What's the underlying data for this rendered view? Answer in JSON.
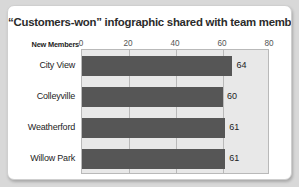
{
  "card": {
    "title": "“Customers-won” infographic shared with team members"
  },
  "chart_data": {
    "type": "bar",
    "orientation": "horizontal",
    "title": "“Customers-won” infographic shared with team members",
    "xlabel": "New Members",
    "ylabel": "",
    "categories": [
      "City View",
      "Colleyville",
      "Weatherford",
      "Willow Park"
    ],
    "values": [
      64,
      60,
      61,
      61
    ],
    "value_labels": [
      "64",
      "60",
      "61",
      "61"
    ],
    "xlim": [
      0,
      80
    ],
    "xticks": [
      0,
      20,
      40,
      60,
      80
    ],
    "xtick_labels": [
      "0",
      "20",
      "40",
      "60",
      "80"
    ],
    "grid": true,
    "legend": false,
    "bar_color": "#565656",
    "plot_background": "#e8e8e8",
    "plot_border_color": "#b9b9b9"
  },
  "colors": {
    "page_background": "#d8d8d8",
    "card_background": "#ffffff",
    "card_border": "#cfcfcf",
    "title_text": "#2b2b2b",
    "label_text": "#1d1d1d",
    "tick_text": "#555555"
  }
}
